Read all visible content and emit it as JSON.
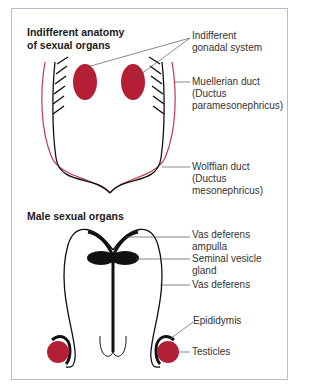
{
  "sections": {
    "indifferent": {
      "title_line1": "Indifferent anatomy",
      "title_line2": "of sexual organs",
      "labels": {
        "gonadal": [
          "Indifferent",
          "gonadal system"
        ],
        "muellerian": [
          "Muellerian duct",
          "(Ductus",
          "paramesonephricus)"
        ],
        "wolffian": [
          "Wolffian duct",
          "(Ductus",
          "mesonephricus)"
        ]
      }
    },
    "male": {
      "title": "Male sexual organs",
      "labels": {
        "ampulla": [
          "Vas deferens",
          "ampulla"
        ],
        "seminal": [
          "Seminal vesicle",
          "gland"
        ],
        "vas": [
          "Vas deferens"
        ],
        "epididymis": [
          "Epididymis"
        ],
        "testicles": [
          "Testicles"
        ]
      }
    }
  },
  "colors": {
    "gonad_red": "#b51f35",
    "muellerian_red": "#c0394b",
    "line_black": "#111111",
    "frame_border": "#b9bccb",
    "leader_gray": "#555555"
  }
}
